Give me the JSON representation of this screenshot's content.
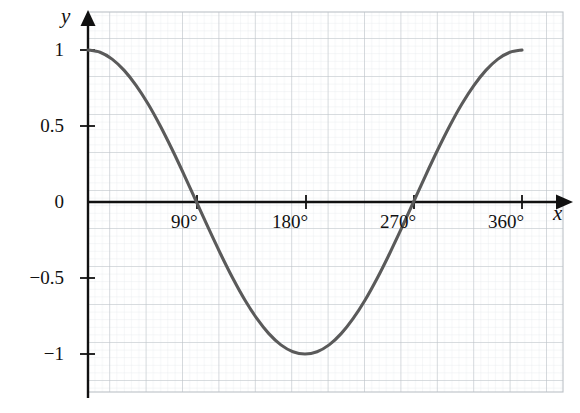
{
  "figure": {
    "kind": "cosine-curve-graph",
    "background_color": "#ffffff",
    "curve_color": "#5a5a5a",
    "axis_color": "#111111",
    "major_grid_color": "#b9bfc4",
    "minor_grid_color": "#e3e7ea"
  },
  "axes": {
    "x_axis_label": "x",
    "y_axis_label": "y"
  },
  "chart_data": {
    "type": "line",
    "title": "",
    "subtitle": "",
    "xlabel": "x",
    "ylabel": "y",
    "xlim": [
      0,
      392
    ],
    "ylim": [
      -1.23,
      1.23
    ],
    "grid": true,
    "minor_grid": true,
    "legend": "none",
    "x_unit": "degrees",
    "xticks": [
      90,
      180,
      270,
      360
    ],
    "xtick_labels": [
      "90°",
      "180°",
      "270°",
      "360°"
    ],
    "yticks": [
      1,
      0.5,
      0,
      -0.5,
      -1
    ],
    "ytick_labels": [
      "1",
      "0.5",
      "0",
      "−0.5",
      "−1"
    ],
    "x_major_step": 30,
    "y_major_step": 0.25,
    "x_minor_step": 6,
    "y_minor_step": 0.05,
    "series": [
      {
        "name": "y = cos(x)",
        "equation": "y = cos x",
        "domain": [
          0,
          360
        ],
        "x": [
          0,
          10,
          20,
          30,
          40,
          50,
          60,
          70,
          80,
          90,
          100,
          110,
          120,
          130,
          140,
          150,
          160,
          170,
          180,
          190,
          200,
          210,
          220,
          230,
          240,
          250,
          260,
          270,
          280,
          290,
          300,
          310,
          320,
          330,
          340,
          350,
          360
        ],
        "values": [
          1,
          0.985,
          0.94,
          0.866,
          0.766,
          0.643,
          0.5,
          0.342,
          0.174,
          0,
          -0.174,
          -0.342,
          -0.5,
          -0.643,
          -0.766,
          -0.866,
          -0.94,
          -0.985,
          -1,
          -0.985,
          -0.94,
          -0.866,
          -0.766,
          -0.643,
          -0.5,
          -0.342,
          -0.174,
          0,
          0.174,
          0.342,
          0.5,
          0.643,
          0.766,
          0.866,
          0.94,
          0.985,
          1
        ],
        "key_points": [
          {
            "x": 0,
            "y": 1,
            "kind": "maximum"
          },
          {
            "x": 90,
            "y": 0,
            "kind": "zero-crossing"
          },
          {
            "x": 180,
            "y": -1,
            "kind": "minimum"
          },
          {
            "x": 270,
            "y": 0,
            "kind": "zero-crossing"
          },
          {
            "x": 360,
            "y": 1,
            "kind": "maximum"
          }
        ]
      }
    ]
  }
}
